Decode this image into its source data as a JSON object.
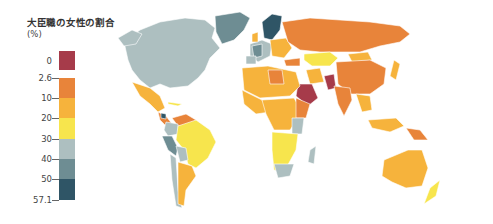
{
  "legend": {
    "title": "大臣職の女性の割合",
    "unit": "(%)",
    "no_data_label": "0",
    "no_data_color": "#a63b4a",
    "bins": [
      {
        "from": "2.6",
        "to": "10",
        "color": "#e8843a"
      },
      {
        "from": "10",
        "to": "20",
        "color": "#f6b33c"
      },
      {
        "from": "20",
        "to": "30",
        "color": "#f7e54d"
      },
      {
        "from": "30",
        "to": "40",
        "color": "#adbfc0"
      },
      {
        "from": "40",
        "to": "50",
        "color": "#6e8d93"
      },
      {
        "from": "50",
        "to": "57.1",
        "color": "#2f5566"
      }
    ],
    "tick_labels": [
      "2.6",
      "10",
      "20",
      "30",
      "40",
      "50",
      "57.1"
    ]
  },
  "map": {
    "subject": "World map of share of women in ministerial positions",
    "regions": [
      {
        "name": "North America (Canada/USA)",
        "class": "30-40"
      },
      {
        "name": "Greenland",
        "class": "40-50"
      },
      {
        "name": "Mexico",
        "class": "10-20"
      },
      {
        "name": "South America (Brazil)",
        "class": "20-30"
      },
      {
        "name": "Peru/Chile west coast",
        "class": "40-50"
      },
      {
        "name": "Argentina",
        "class": "10-20"
      },
      {
        "name": "Scandinavia",
        "class": "50-57.1"
      },
      {
        "name": "Western Europe",
        "class": "30-40"
      },
      {
        "name": "Russia",
        "class": "2.6-10"
      },
      {
        "name": "Kazakhstan",
        "class": "20-30"
      },
      {
        "name": "China",
        "class": "2.6-10"
      },
      {
        "name": "Saudi Arabia",
        "class": "0"
      },
      {
        "name": "Pakistan",
        "class": "0"
      },
      {
        "name": "India",
        "class": "2.6-10"
      },
      {
        "name": "Africa",
        "class": "10-20"
      },
      {
        "name": "South Africa",
        "class": "30-40"
      },
      {
        "name": "Madagascar",
        "class": "30-40"
      },
      {
        "name": "Australia",
        "class": "10-20"
      },
      {
        "name": "New Zealand",
        "class": "20-30"
      },
      {
        "name": "Japan",
        "class": "10-20"
      },
      {
        "name": "Indonesia",
        "class": "10-20"
      }
    ]
  }
}
